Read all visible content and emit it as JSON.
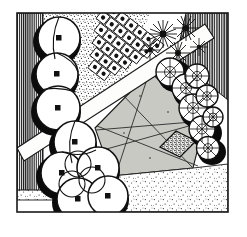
{
  "artwork": {
    "title": "Garden Plan Illustration",
    "medium": "pen-and-ink line drawing",
    "subject": "aerial plan view of an enclosed walled garden",
    "palette": {
      "ink": "#111111",
      "paper": "#ffffff",
      "lawn_fill": "#c9c9c4",
      "path_fill": "#fdfdfb",
      "gravel_fill": "#f2f2ef",
      "shadow": "#0b0b0b",
      "frame": "#1a1a1a"
    },
    "frame": {
      "name": "drawing-border",
      "x": 17,
      "y": 13,
      "width": 211,
      "height": 199,
      "stroke_width": 1.6
    },
    "regions": [
      {
        "id": "west-wall",
        "label": "West boundary wall",
        "texture": "vertical-hatching",
        "hatch_spacing": 2.1
      },
      {
        "id": "north-east-wall",
        "label": "North-east boundary wall",
        "texture": "vertical-hatching",
        "hatch_spacing": 2.1
      },
      {
        "id": "north-stipple-bed",
        "label": "Stippled planting bed",
        "texture": "dense-stipple"
      },
      {
        "id": "south-gravel",
        "label": "Gravel terrace",
        "texture": "medium-stipple"
      },
      {
        "id": "south-west-gravel",
        "label": "Gravel corner",
        "texture": "medium-stipple"
      },
      {
        "id": "central-lawn",
        "label": "Central lawn with crossing mower stripes",
        "texture": "flat-grey",
        "mow_lines": 5
      },
      {
        "id": "diagonal-path",
        "label": "Diagonal paved path",
        "texture": "blank-white"
      }
    ],
    "features": [
      {
        "id": "tree-row-west",
        "label": "Row of round-canopy trees along west wall",
        "symbol": "circle-with-centre-dot",
        "count": 3
      },
      {
        "id": "tree-cluster-south-west",
        "label": "Cluster of overlapping round-canopy trees",
        "symbol": "overlapping-circles-with-centre-dot",
        "count": 5
      },
      {
        "id": "formal-bed-grid",
        "label": "Formal grid bed of clipped squares with ball topiary",
        "symbol": "square-with-inner-circle",
        "rows": 6,
        "columns": 7
      },
      {
        "id": "flower-burst-group",
        "label": "Group of star-burst flowering perennials",
        "symbol": "radiating-petal-star",
        "count": 5
      },
      {
        "id": "shrub-chain",
        "label": "Diagonal chain of textured spoked shrubs",
        "symbol": "circle-with-radiating-spokes",
        "count": 8
      },
      {
        "id": "lozenge-feature",
        "label": "Dark stippled diamond feature bed",
        "symbol": "hatched-lozenge",
        "count": 1
      }
    ]
  }
}
